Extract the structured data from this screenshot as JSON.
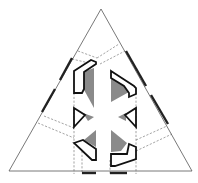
{
  "diagram": {
    "title": "",
    "colors": {
      "outline": "#555555",
      "dashed": "#666666",
      "bold": "#222222",
      "shade": "#8a8a8a",
      "background": "#ffffff"
    },
    "triangle": {
      "apex": [
        101,
        9
      ],
      "left": [
        9,
        171
      ],
      "right": [
        192,
        171
      ]
    },
    "labels": []
  }
}
